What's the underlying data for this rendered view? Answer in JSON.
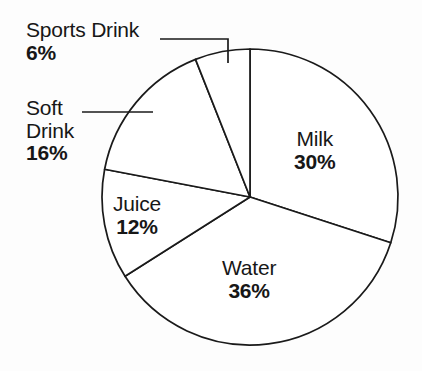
{
  "chart_data": {
    "type": "pie",
    "title": "",
    "categories": [
      "Milk",
      "Water",
      "Juice",
      "Soft Drink",
      "Sports Drink"
    ],
    "values": [
      30,
      36,
      12,
      16,
      6
    ],
    "unit": "%",
    "total": 100,
    "legend": "none",
    "grid": false,
    "start_angle_deg": 0,
    "direction": "clockwise",
    "slices": [
      {
        "label": "Milk",
        "value": 30,
        "value_text": "30%",
        "start_deg": 0,
        "end_deg": 108,
        "sweep_deg": 108,
        "label_placement": "inside"
      },
      {
        "label": "Water",
        "value": 36,
        "value_text": "36%",
        "start_deg": 108,
        "end_deg": 237.6,
        "sweep_deg": 129.6,
        "label_placement": "inside"
      },
      {
        "label": "Juice",
        "value": 12,
        "value_text": "12%",
        "start_deg": 237.6,
        "end_deg": 280.8,
        "sweep_deg": 43.2,
        "label_placement": "inside"
      },
      {
        "label": "Soft Drink",
        "value": 16,
        "value_text": "16%",
        "start_deg": 280.8,
        "end_deg": 338.4,
        "sweep_deg": 57.6,
        "label_placement": "outside-leader"
      },
      {
        "label": "Sports Drink",
        "value": 6,
        "value_text": "6%",
        "start_deg": 338.4,
        "end_deg": 360,
        "sweep_deg": 21.6,
        "label_placement": "outside-leader"
      }
    ],
    "colors": {
      "slice_fill": "#ffffff",
      "slice_stroke": "#1a1a1a",
      "background": "#fdfdfd",
      "text": "#171717"
    }
  },
  "labels": {
    "sports_drink": {
      "name": "Sports Drink",
      "value": "6%"
    },
    "soft_drink": {
      "name_line1": "Soft",
      "name_line2": "Drink",
      "value": "16%"
    },
    "milk": {
      "name": "Milk",
      "value": "30%"
    },
    "juice": {
      "name": "Juice",
      "value": "12%"
    },
    "water": {
      "name": "Water",
      "value": "36%"
    }
  }
}
